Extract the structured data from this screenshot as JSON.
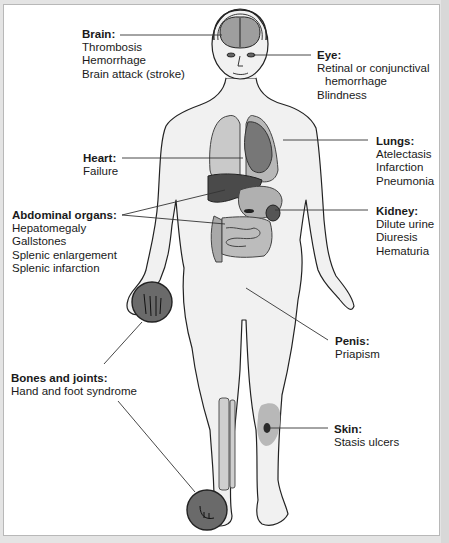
{
  "figure": {
    "colors": {
      "background": "#ffffff",
      "frame_border": "#b8b8b8",
      "skin_fill": "#f1f1f1",
      "outline": "#222222",
      "organ_light": "#c8c8c8",
      "organ_mid": "#9a9a9a",
      "organ_dark": "#4a4a4a",
      "highlight_circle": "#6a6a6a",
      "leader_line": "#333333"
    },
    "callouts": {
      "brain": {
        "title": "Brain:",
        "items": [
          "Thrombosis",
          "Hemorrhage",
          "Brain attack (stroke)"
        ]
      },
      "eye": {
        "title": "Eye:",
        "items": [
          "Retinal or conjunctival",
          "hemorrhage",
          "Blindness"
        ]
      },
      "lungs": {
        "title": "Lungs:",
        "items": [
          "Atelectasis",
          "Infarction",
          "Pneumonia"
        ]
      },
      "heart": {
        "title": "Heart:",
        "items": [
          "Failure"
        ]
      },
      "abdominal": {
        "title": "Abdominal organs:",
        "items": [
          "Hepatomegaly",
          "Gallstones",
          "Splenic enlargement",
          "Splenic infarction"
        ]
      },
      "kidney": {
        "title": "Kidney:",
        "items": [
          "Dilute urine",
          "Diuresis",
          "Hematuria"
        ]
      },
      "penis": {
        "title": "Penis:",
        "items": [
          "Priapism"
        ]
      },
      "bones": {
        "title": "Bones and joints:",
        "items": [
          "Hand and foot syndrome"
        ]
      },
      "skin": {
        "title": "Skin:",
        "items": [
          "Stasis ulcers"
        ]
      }
    }
  }
}
